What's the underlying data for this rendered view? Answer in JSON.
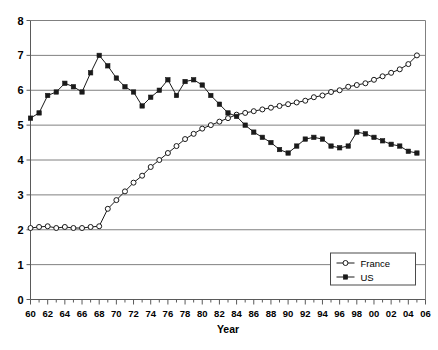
{
  "chart_data": {
    "type": "line",
    "title": "",
    "subtitle": "",
    "xlabel": "Year",
    "ylabel": "",
    "xlim": [
      1960,
      2006
    ],
    "ylim": [
      0,
      8
    ],
    "grid": true,
    "grid_axis": "y",
    "legend_position": "bottom-right",
    "x": [
      1960,
      1961,
      1962,
      1963,
      1964,
      1965,
      1966,
      1967,
      1968,
      1969,
      1970,
      1971,
      1972,
      1973,
      1974,
      1975,
      1976,
      1977,
      1978,
      1979,
      1980,
      1981,
      1982,
      1983,
      1984,
      1985,
      1986,
      1987,
      1988,
      1989,
      1990,
      1991,
      1992,
      1993,
      1994,
      1995,
      1996,
      1997,
      1998,
      1999,
      2000,
      2001,
      2002,
      2003,
      2004,
      2005
    ],
    "xtick_labels": [
      "60",
      "62",
      "64",
      "66",
      "68",
      "70",
      "72",
      "74",
      "76",
      "78",
      "80",
      "82",
      "84",
      "86",
      "88",
      "90",
      "92",
      "94",
      "96",
      "98",
      "00",
      "02",
      "04",
      "06"
    ],
    "xtick_values": [
      1960,
      1962,
      1964,
      1966,
      1968,
      1970,
      1972,
      1974,
      1976,
      1978,
      1980,
      1982,
      1984,
      1986,
      1988,
      1990,
      1992,
      1994,
      1996,
      1998,
      2000,
      2002,
      2004,
      2006
    ],
    "ytick_labels": [
      "0",
      "1",
      "2",
      "3",
      "4",
      "5",
      "6",
      "7",
      "8"
    ],
    "ytick_values": [
      0,
      1,
      2,
      3,
      4,
      5,
      6,
      7,
      8
    ],
    "series": [
      {
        "name": "France",
        "marker": "open-circle",
        "color": "#1a1a1a",
        "values": [
          2.05,
          2.08,
          2.1,
          2.05,
          2.08,
          2.05,
          2.05,
          2.08,
          2.1,
          2.6,
          2.85,
          3.1,
          3.35,
          3.55,
          3.8,
          4.0,
          4.2,
          4.4,
          4.6,
          4.75,
          4.9,
          5.0,
          5.1,
          5.2,
          5.3,
          5.35,
          5.4,
          5.45,
          5.5,
          5.55,
          5.6,
          5.65,
          5.7,
          5.8,
          5.85,
          5.95,
          6.0,
          6.1,
          6.15,
          6.2,
          6.3,
          6.4,
          6.5,
          6.6,
          6.75,
          7.0
        ]
      },
      {
        "name": "US",
        "marker": "filled-square",
        "color": "#1a1a1a",
        "values": [
          5.2,
          5.35,
          5.85,
          5.95,
          6.2,
          6.1,
          5.95,
          6.5,
          7.0,
          6.7,
          6.35,
          6.1,
          5.95,
          5.55,
          5.8,
          6.0,
          6.3,
          5.85,
          6.25,
          6.3,
          6.15,
          5.85,
          5.6,
          5.35,
          5.25,
          5.0,
          4.8,
          4.65,
          4.5,
          4.3,
          4.2,
          4.4,
          4.6,
          4.65,
          4.6,
          4.4,
          4.35,
          4.4,
          4.8,
          4.75,
          4.65,
          4.55,
          4.45,
          4.4,
          4.25,
          4.2
        ]
      }
    ]
  },
  "legend": {
    "items": [
      {
        "label": "France"
      },
      {
        "label": "US"
      }
    ]
  },
  "axes": {
    "x_title": "Year"
  }
}
